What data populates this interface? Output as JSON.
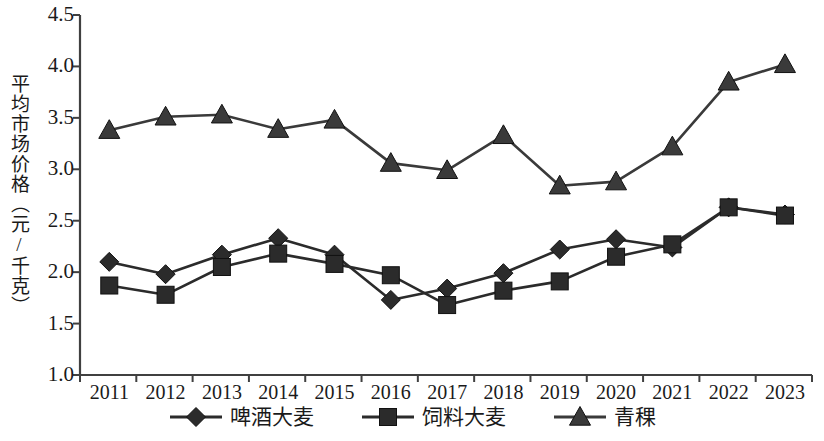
{
  "chart_data": {
    "type": "line",
    "title": "",
    "xlabel": "",
    "ylabel": "平均市场价格（元/千克）",
    "categories": [
      "2011",
      "2012",
      "2013",
      "2014",
      "2015",
      "2016",
      "2017",
      "2018",
      "2019",
      "2020",
      "2021",
      "2022",
      "2023"
    ],
    "ylim": [
      1.0,
      4.5
    ],
    "ytick_labels": [
      "1.0",
      "1.5",
      "2.0",
      "2.5",
      "3.0",
      "3.5",
      "4.0",
      "4.5"
    ],
    "ytick_values": [
      1.0,
      1.5,
      2.0,
      2.5,
      3.0,
      3.5,
      4.0,
      4.5
    ],
    "grid": false,
    "legend_position": "bottom",
    "series": [
      {
        "name": "啤酒大麦",
        "marker": "diamond",
        "color": "#2b2b2b",
        "values": [
          2.1,
          1.98,
          2.17,
          2.33,
          2.17,
          1.73,
          1.84,
          1.99,
          2.22,
          2.32,
          2.24,
          2.63,
          2.56
        ]
      },
      {
        "name": "饲料大麦",
        "marker": "square",
        "color": "#2b2b2b",
        "values": [
          1.87,
          1.78,
          2.05,
          2.18,
          2.08,
          1.97,
          1.68,
          1.82,
          1.91,
          2.15,
          2.27,
          2.63,
          2.55
        ]
      },
      {
        "name": "青稞",
        "marker": "triangle",
        "color": "#3a3a3a",
        "values": [
          3.38,
          3.51,
          3.53,
          3.39,
          3.48,
          3.06,
          2.99,
          3.33,
          2.84,
          2.88,
          3.22,
          3.85,
          4.02
        ]
      }
    ]
  },
  "axis": {
    "line_color": "#404040"
  }
}
